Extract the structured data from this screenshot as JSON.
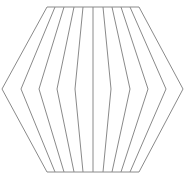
{
  "diagram": {
    "shape": "hexagon-with-bulging-lines",
    "stroke_color": "#8a8a8a",
    "background": "#ffffff",
    "stroke_width": 1,
    "top_y": 7,
    "mid_y": 89,
    "bottom_y": 172,
    "lines": [
      {
        "top_x": 47,
        "mid_x": 2,
        "bottom_x": 47
      },
      {
        "top_x": 55,
        "mid_x": 21,
        "bottom_x": 55
      },
      {
        "top_x": 64,
        "mid_x": 39,
        "bottom_x": 64
      },
      {
        "top_x": 74,
        "mid_x": 57,
        "bottom_x": 74
      },
      {
        "top_x": 83,
        "mid_x": 75,
        "bottom_x": 83
      },
      {
        "top_x": 93,
        "mid_x": 93,
        "bottom_x": 93
      },
      {
        "top_x": 103,
        "mid_x": 111,
        "bottom_x": 103
      },
      {
        "top_x": 112,
        "mid_x": 130,
        "bottom_x": 112
      },
      {
        "top_x": 121,
        "mid_x": 148,
        "bottom_x": 121
      },
      {
        "top_x": 130,
        "mid_x": 166,
        "bottom_x": 130
      },
      {
        "top_x": 139,
        "mid_x": 183,
        "bottom_x": 139
      }
    ]
  }
}
